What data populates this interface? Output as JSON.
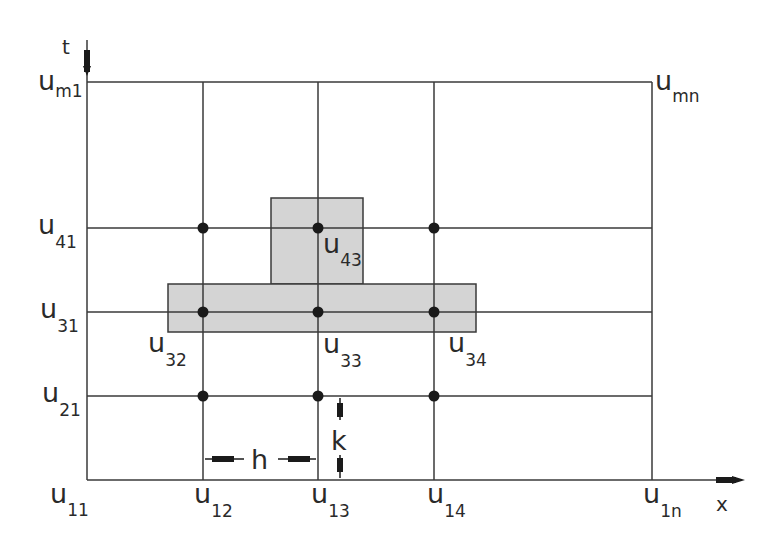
{
  "diagram": {
    "title": "",
    "axes": {
      "t_label": "t",
      "x_label": "x"
    },
    "spacing": {
      "h_label": "h",
      "k_label": "k"
    },
    "colors": {
      "line": "#3a3a3a",
      "shade": "#d4d4d4",
      "node": "#1a1a1a",
      "text": "#2a2a2a"
    },
    "labels": {
      "u_m1": {
        "base": "u",
        "sub": "m1"
      },
      "u_mn": {
        "base": "u",
        "sub": "mn"
      },
      "u_41": {
        "base": "u",
        "sub": "41"
      },
      "u_31": {
        "base": "u",
        "sub": "31"
      },
      "u_21": {
        "base": "u",
        "sub": "21"
      },
      "u_11": {
        "base": "u",
        "sub": "11"
      },
      "u_12": {
        "base": "u",
        "sub": "12"
      },
      "u_13": {
        "base": "u",
        "sub": "13"
      },
      "u_14": {
        "base": "u",
        "sub": "14"
      },
      "u_1n": {
        "base": "u",
        "sub": "1n"
      },
      "u_43": {
        "base": "u",
        "sub": "43"
      },
      "u_32": {
        "base": "u",
        "sub": "32"
      },
      "u_33": {
        "base": "u",
        "sub": "33"
      },
      "u_34": {
        "base": "u",
        "sub": "34"
      }
    },
    "grid": {
      "columns_x": [
        87,
        203,
        318,
        434,
        652
      ],
      "rows_y": [
        82,
        228,
        312,
        396,
        480
      ]
    },
    "nodes": [
      {
        "row": 4,
        "col": 2
      },
      {
        "row": 4,
        "col": 3
      },
      {
        "row": 4,
        "col": 4
      },
      {
        "row": 3,
        "col": 2
      },
      {
        "row": 3,
        "col": 3
      },
      {
        "row": 3,
        "col": 4
      },
      {
        "row": 2,
        "col": 2
      },
      {
        "row": 2,
        "col": 3
      },
      {
        "row": 2,
        "col": 4
      }
    ],
    "stencil": {
      "description": "Shaded stencil region covering u32, u33, u34 and u43"
    }
  }
}
